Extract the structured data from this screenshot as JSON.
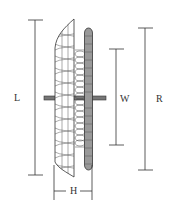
{
  "diagram": {
    "dimensions": {
      "L": {
        "label": "L"
      },
      "W": {
        "label": "W"
      },
      "R": {
        "label": "R"
      },
      "H": {
        "label": "H"
      }
    },
    "colors": {
      "line": "#333333",
      "background": "#ffffff",
      "ring_fill": "#888888"
    }
  }
}
